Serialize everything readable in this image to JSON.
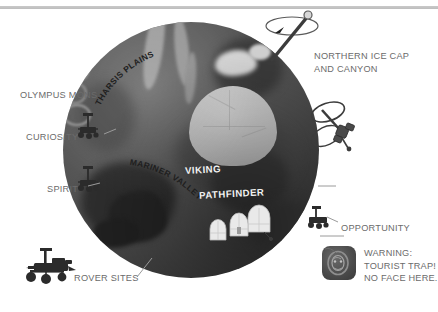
{
  "page": {
    "background_color": "#ffffff",
    "top_rule_color": "#c3c3c3"
  },
  "globe": {
    "name": "mars-globe",
    "body_color": "#4e4e4e",
    "highlight_color": "#6e6e6e",
    "shadow_color": "#343434",
    "ice_color": "#d2d2d2",
    "basin_color": "#cacaca"
  },
  "callouts": [
    {
      "id": "northern-ice-cap",
      "label": "NORTHERN ICE CAP\nAND CANYON",
      "x": 314,
      "y": 55
    },
    {
      "id": "olympus-mons",
      "label": "OLYMPUS MONS",
      "x": 20,
      "y": 90
    },
    {
      "id": "curiosity",
      "label": "CURIOSITY",
      "x": 26,
      "y": 133
    },
    {
      "id": "spirit",
      "label": "SPIRIT",
      "x": 46,
      "y": 184
    },
    {
      "id": "rover-sites",
      "label": "ROVER SITES",
      "x": 74,
      "y": 275
    },
    {
      "id": "opportunity",
      "label": "OPPORTUNITY",
      "x": 341,
      "y": 224
    }
  ],
  "surface_labels": [
    {
      "id": "tharsis-plains",
      "label": "THARSIS PLAINS",
      "style": "curved-dark"
    },
    {
      "id": "mariner-valley",
      "label": "MARINER VALLEY",
      "style": "curved-dark"
    },
    {
      "id": "viking",
      "label": "VIKING",
      "style": "light"
    },
    {
      "id": "pathfinder",
      "label": "PATHFINDER",
      "style": "light"
    }
  ],
  "warning": {
    "icon_name": "face-on-mars-icon",
    "text": "WARNING:\nTOURIST TRAP!\nNO FACE HERE.",
    "text_color": "#6b6b6b",
    "icon_background": "#4a4a4a"
  },
  "icons": [
    {
      "id": "rotation-axis",
      "name": "rotation-axis-icon"
    },
    {
      "id": "orbiter",
      "name": "orbiter-satellite-icon"
    },
    {
      "id": "rover-curiosity",
      "name": "rover-icon"
    },
    {
      "id": "rover-spirit",
      "name": "rover-icon"
    },
    {
      "id": "rover-opportunity",
      "name": "rover-icon"
    },
    {
      "id": "rover-legend",
      "name": "rover-legend-icon"
    },
    {
      "id": "habitat-domes",
      "name": "habitat-domes-icon"
    }
  ]
}
